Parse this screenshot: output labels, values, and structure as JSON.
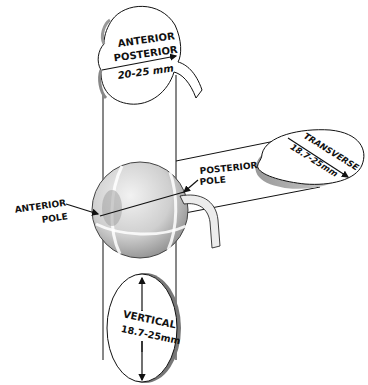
{
  "diagram": {
    "labels": {
      "anterior_posterior_line1": "ANTERIOR",
      "anterior_posterior_line2": "POSTERIOR",
      "anterior_posterior_value": "20-25 mm",
      "transverse_label": "TRANSVERSE",
      "transverse_value": "18.7-25mm",
      "vertical_label": "VERTICAL",
      "vertical_value": "18.7-25mm",
      "anterior_pole_line1": "ANTERIOR",
      "anterior_pole_line2": "POLE",
      "posterior_pole_line1": "POSTERIOR",
      "posterior_pole_line2": "POLE"
    },
    "colors": {
      "ink": "#111111",
      "disc_fill": "#ffffff",
      "disc_edge": "#b8b8b8",
      "eyeball_fill": "#d9d9d9",
      "eyeball_shade": "#a8a8a8"
    }
  }
}
